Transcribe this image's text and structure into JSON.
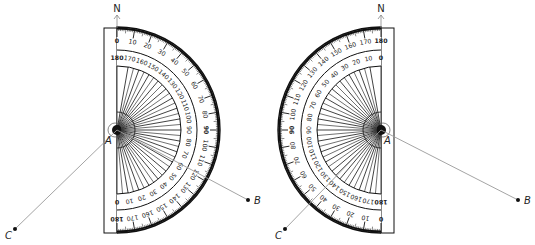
{
  "figures": [
    {
      "id": "left",
      "orientation": "arc-right",
      "center": [
        117,
        130
      ],
      "labels": {
        "north": "N",
        "vertex": "A",
        "point_b": "B",
        "point_c": "C"
      },
      "points": {
        "B": [
          248,
          200
        ],
        "C": [
          15,
          229
        ]
      },
      "outer_scale": [
        "0",
        "10",
        "20",
        "30",
        "40",
        "50",
        "60",
        "70",
        "80",
        "90",
        "100",
        "110",
        "120",
        "130",
        "140",
        "150",
        "160",
        "170",
        "180"
      ],
      "inner_scale": [
        "180",
        "170",
        "160",
        "150",
        "140",
        "130",
        "120",
        "110",
        "100",
        "90",
        "80",
        "70",
        "60",
        "50",
        "40",
        "30",
        "20",
        "10",
        "0"
      ]
    },
    {
      "id": "right",
      "orientation": "arc-left",
      "center": [
        381,
        130
      ],
      "labels": {
        "north": "N",
        "vertex": "A",
        "point_b": "B",
        "point_c": "C"
      },
      "points": {
        "B": [
          518,
          200
        ],
        "C": [
          285,
          229
        ]
      },
      "outer_scale": [
        "180",
        "170",
        "160",
        "150",
        "140",
        "130",
        "120",
        "110",
        "100",
        "90",
        "80",
        "70",
        "60",
        "50",
        "40",
        "30",
        "20",
        "10",
        "0"
      ],
      "inner_scale": [
        "0",
        "10",
        "20",
        "30",
        "40",
        "50",
        "60",
        "70",
        "80",
        "90",
        "100",
        "110",
        "120",
        "130",
        "140",
        "150",
        "160",
        "170",
        "180"
      ]
    }
  ],
  "colors": {
    "ink": "#111111",
    "ray": "#9a9a9a",
    "arrow": "#888888"
  }
}
